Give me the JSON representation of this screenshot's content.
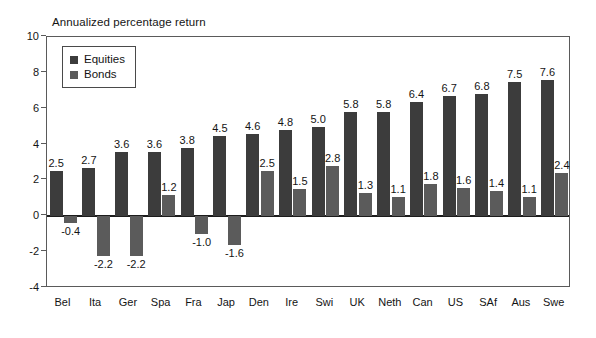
{
  "chart_data": {
    "type": "bar",
    "title": "Annualized percentage return",
    "xlabel": "",
    "ylabel": "",
    "ylim": [
      -4,
      10
    ],
    "yticks": [
      10,
      8,
      6,
      4,
      2,
      0,
      -2,
      -4
    ],
    "ytick_labels": [
      "10",
      "8",
      "6",
      "4",
      "2",
      "0",
      "-2",
      "-4"
    ],
    "grid": false,
    "legend_position": "upper-left-inside",
    "categories": [
      "Bel",
      "Ita",
      "Ger",
      "Spa",
      "Fra",
      "Jap",
      "Den",
      "Ire",
      "Swi",
      "UK",
      "Neth",
      "Can",
      "US",
      "SAf",
      "Aus",
      "Swe"
    ],
    "series": [
      {
        "name": "Equities",
        "color": "#3c3c3c",
        "values": [
          2.5,
          2.7,
          3.6,
          3.6,
          3.8,
          4.5,
          4.6,
          4.8,
          5.0,
          5.8,
          5.8,
          6.4,
          6.7,
          6.8,
          7.5,
          7.6
        ],
        "labels": [
          "2.5",
          "2.7",
          "3.6",
          "3.6",
          "3.8",
          "4.5",
          "4.6",
          "4.8",
          "5.0",
          "5.8",
          "5.8",
          "6.4",
          "6.7",
          "6.8",
          "7.5",
          "7.6"
        ]
      },
      {
        "name": "Bonds",
        "color": "#5b5b5b",
        "values": [
          -0.4,
          -2.2,
          -2.2,
          1.2,
          -1.0,
          -1.6,
          2.5,
          1.5,
          2.8,
          1.3,
          1.1,
          1.8,
          1.6,
          1.4,
          1.1,
          2.4
        ],
        "labels": [
          "-0.4",
          "-2.2",
          "-2.2",
          "1.2",
          "-1.0",
          "-1.6",
          "2.5",
          "1.5",
          "2.8",
          "1.3",
          "1.1",
          "1.8",
          "1.6",
          "1.4",
          "1.1",
          "2.4"
        ]
      }
    ]
  },
  "legend": {
    "items": [
      {
        "label": "Equities",
        "swatch": "equities"
      },
      {
        "label": "Bonds",
        "swatch": "bonds"
      }
    ]
  }
}
